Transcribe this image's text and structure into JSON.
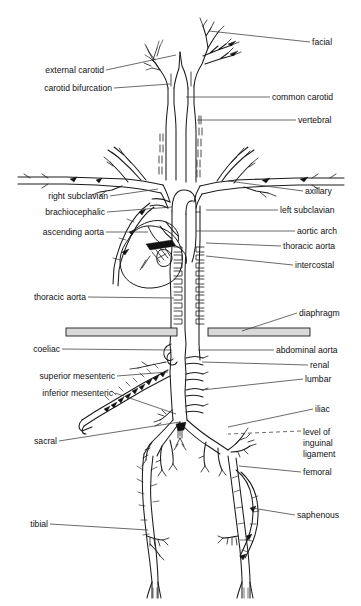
{
  "figure": {
    "background_color": "#ffffff",
    "line_color": "#1b1b1b",
    "leader_color": "#3a3a3a",
    "diaphragm_fill": "#d9d9d9",
    "width": 361,
    "height": 606
  },
  "labels_left": [
    {
      "id": "external-carotid",
      "text": "external carotid",
      "x": 104,
      "y": 73,
      "lead_to_x": 176,
      "lead_to_y": 55
    },
    {
      "id": "carotid-bifurcation",
      "text": "carotid bifurcation",
      "x": 112,
      "y": 91,
      "lead_to_x": 170,
      "lead_to_y": 84
    },
    {
      "id": "right-subclavian",
      "text": "right subclavian",
      "x": 108,
      "y": 199,
      "lead_to_x": 158,
      "lead_to_y": 189
    },
    {
      "id": "brachiocephalic",
      "text": "brachiocephalic",
      "x": 105,
      "y": 215,
      "lead_to_x": 172,
      "lead_to_y": 207
    },
    {
      "id": "ascending-aorta",
      "text": "ascending aorta",
      "x": 104,
      "y": 235,
      "lead_to_x": 148,
      "lead_to_y": 232
    },
    {
      "id": "thoracic-aorta-left",
      "text": "thoracic aorta",
      "x": 86,
      "y": 300,
      "lead_to_x": 174,
      "lead_to_y": 298
    },
    {
      "id": "coeliac",
      "text": "coeliac",
      "x": 60,
      "y": 352,
      "lead_to_x": 172,
      "lead_to_y": 350
    },
    {
      "id": "superior-mesenteric",
      "text": "superior mesenteric",
      "x": 115,
      "y": 379,
      "lead_to_x": 168,
      "lead_to_y": 372
    },
    {
      "id": "inferior-mesenteric",
      "text": "inferior mesenteric",
      "x": 113,
      "y": 396,
      "lead_to_x": 176,
      "lead_to_y": 414
    },
    {
      "id": "sacral",
      "text": "sacral",
      "x": 57,
      "y": 444,
      "lead_to_x": 180,
      "lead_to_y": 422
    },
    {
      "id": "tibial",
      "text": "tibial",
      "x": 48,
      "y": 527,
      "lead_to_x": 148,
      "lead_to_y": 530
    }
  ],
  "labels_right": [
    {
      "id": "facial",
      "text": "facial",
      "x": 312,
      "y": 45,
      "lead_to_x": 209,
      "lead_to_y": 31
    },
    {
      "id": "common-carotid",
      "text": "common carotid",
      "x": 272,
      "y": 100,
      "lead_to_x": 186,
      "lead_to_y": 97
    },
    {
      "id": "vertebral",
      "text": "vertebral",
      "x": 298,
      "y": 123,
      "lead_to_x": 197,
      "lead_to_y": 120
    },
    {
      "id": "axillary",
      "text": "axillary",
      "x": 305,
      "y": 194,
      "lead_to_x": 228,
      "lead_to_y": 181
    },
    {
      "id": "left-subclavian",
      "text": "left subclavian",
      "x": 280,
      "y": 213,
      "lead_to_x": 206,
      "lead_to_y": 210
    },
    {
      "id": "aortic-arch",
      "text": "aortic arch",
      "x": 297,
      "y": 234,
      "lead_to_x": 196,
      "lead_to_y": 231
    },
    {
      "id": "thoracic-aorta-r",
      "text": "thoracic aorta",
      "x": 283,
      "y": 249,
      "lead_to_x": 206,
      "lead_to_y": 243
    },
    {
      "id": "intercostal",
      "text": "intercostal",
      "x": 295,
      "y": 268,
      "lead_to_x": 206,
      "lead_to_y": 256
    },
    {
      "id": "diaphragm",
      "text": "diaphragm",
      "x": 299,
      "y": 316,
      "lead_to_x": 242,
      "lead_to_y": 331
    },
    {
      "id": "abdominal-aorta",
      "text": "abdominal aorta",
      "x": 276,
      "y": 353,
      "lead_to_x": 198,
      "lead_to_y": 350
    },
    {
      "id": "renal",
      "text": "renal",
      "x": 310,
      "y": 368,
      "lead_to_x": 202,
      "lead_to_y": 362
    },
    {
      "id": "lumbar",
      "text": "lumbar",
      "x": 305,
      "y": 382,
      "lead_to_x": 202,
      "lead_to_y": 390
    },
    {
      "id": "iliac",
      "text": "iliac",
      "x": 315,
      "y": 412,
      "lead_to_x": 228,
      "lead_to_y": 427
    },
    {
      "id": "femoral",
      "text": "femoral",
      "x": 303,
      "y": 475,
      "lead_to_x": 239,
      "lead_to_y": 466
    },
    {
      "id": "saphenous",
      "text": "saphenous",
      "x": 297,
      "y": 518,
      "lead_to_x": 252,
      "lead_to_y": 508
    }
  ],
  "labels_right_multiline": [
    {
      "id": "level-of-inguinal-ligament",
      "lines": [
        "level of",
        "inguinal",
        "ligament"
      ],
      "x": 303,
      "y": 435,
      "line_height": 11,
      "lead_to_x": 228,
      "lead_to_y": 434,
      "dashed": true
    }
  ],
  "structures": {
    "heart": "heart-outline",
    "diaphragm_left": "diaphragm-bar-left",
    "diaphragm_right": "diaphragm-bar-right",
    "aorta": "aorta-trunk",
    "carotids": "carotid-arteries",
    "arms": "arm-arteries",
    "legs": "leg-arteries"
  }
}
